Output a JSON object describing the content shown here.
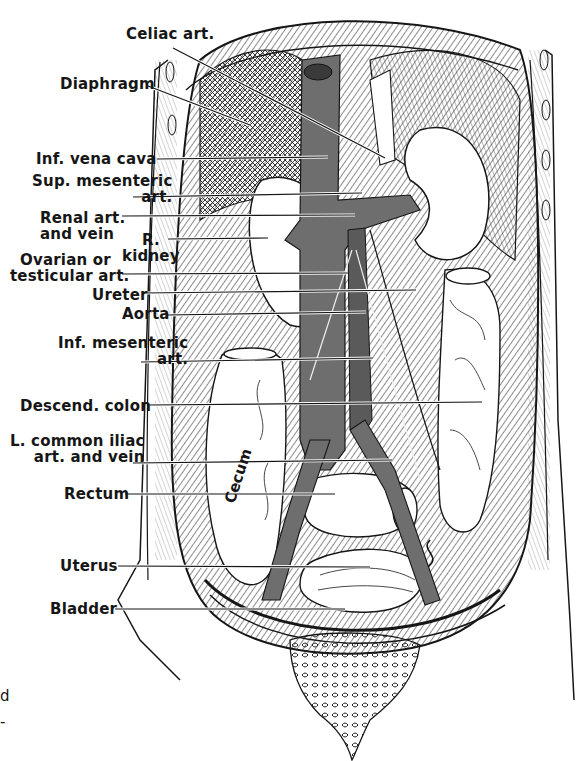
{
  "figure": {
    "type": "anatomical illustration",
    "colors": {
      "ink": "#161616",
      "vessel_fill": "#6e6e6e",
      "organ_fill": "#ffffff",
      "hatch": "#2a2a2a",
      "background": "#ffffff"
    }
  },
  "labels": [
    {
      "id": "celiac-art",
      "lines": [
        "Celiac art."
      ],
      "x": 126,
      "y": 26,
      "leader": [
        [
          173,
          48
        ],
        [
          385,
          158
        ]
      ]
    },
    {
      "id": "diaphragm",
      "lines": [
        "Diaphragm"
      ],
      "x": 60,
      "y": 76,
      "leader": [
        [
          148,
          86
        ],
        [
          250,
          125
        ]
      ]
    },
    {
      "id": "inf-vena-cava",
      "lines": [
        "Inf. vena cava"
      ],
      "x": 36,
      "y": 151,
      "leader": [
        [
          157,
          159
        ],
        [
          328,
          157
        ]
      ]
    },
    {
      "id": "sup-mesenteric-art",
      "lines": [
        "Sup. mesenteric",
        "art."
      ],
      "x": 32,
      "y": 173,
      "leader": [
        [
          133,
          197
        ],
        [
          362,
          193
        ]
      ]
    },
    {
      "id": "renal-art-vein",
      "lines": [
        "Renal art.",
        "and vein"
      ],
      "x": 40,
      "y": 210,
      "leader": [
        [
          122,
          216
        ],
        [
          355,
          215
        ]
      ]
    },
    {
      "id": "r-kidney",
      "lines": [
        "R.",
        "kidney"
      ],
      "x": 122,
      "y": 232,
      "align": "right",
      "leader": [
        [
          168,
          239
        ],
        [
          268,
          238
        ]
      ]
    },
    {
      "id": "ovarian-testicular-art",
      "lines": [
        "Ovarian or",
        "testicular art."
      ],
      "x": 10,
      "y": 252,
      "leader": [
        [
          122,
          274
        ],
        [
          348,
          273
        ]
      ]
    },
    {
      "id": "ureter",
      "lines": [
        "Ureter"
      ],
      "x": 92,
      "y": 292,
      "leader": [
        [
          143,
          293
        ],
        [
          416,
          290
        ]
      ]
    },
    {
      "id": "aorta",
      "lines": [
        "Aorta"
      ],
      "x": 122,
      "y": 307,
      "leader": [
        [
          167,
          315
        ],
        [
          366,
          312
        ]
      ]
    },
    {
      "id": "inf-mesenteric-art",
      "lines": [
        "Inf. mesenteric",
        "art."
      ],
      "x": 58,
      "y": 335,
      "leader": [
        [
          141,
          362
        ],
        [
          373,
          358
        ]
      ]
    },
    {
      "id": "descend-colon",
      "lines": [
        "Descend. colon"
      ],
      "x": 20,
      "y": 398,
      "leader": [
        [
          148,
          405
        ],
        [
          482,
          402
        ]
      ]
    },
    {
      "id": "l-common-iliac",
      "lines": [
        "L. common iliac",
        "art. and vein"
      ],
      "x": 10,
      "y": 433,
      "leader": [
        [
          133,
          463
        ],
        [
          392,
          460
        ]
      ]
    },
    {
      "id": "rectum",
      "lines": [
        "Rectum"
      ],
      "x": 64,
      "y": 486,
      "leader": [
        [
          125,
          494
        ],
        [
          335,
          494
        ]
      ]
    },
    {
      "id": "uterus",
      "lines": [
        "Uterus"
      ],
      "x": 60,
      "y": 558,
      "leader": [
        [
          118,
          566
        ],
        [
          370,
          567
        ]
      ]
    },
    {
      "id": "bladder",
      "lines": [
        "Bladder"
      ],
      "x": 50,
      "y": 601,
      "leader": [
        [
          115,
          609
        ],
        [
          345,
          609
        ]
      ]
    }
  ],
  "inline_labels": [
    {
      "id": "cecum",
      "text": "Cecum",
      "x": 221,
      "y": 500
    }
  ],
  "edge_fragments": [
    {
      "id": "fragment-1",
      "text": "d",
      "x": 0,
      "y": 688
    },
    {
      "id": "fragment-2",
      "text": "-",
      "x": 0,
      "y": 714
    }
  ]
}
